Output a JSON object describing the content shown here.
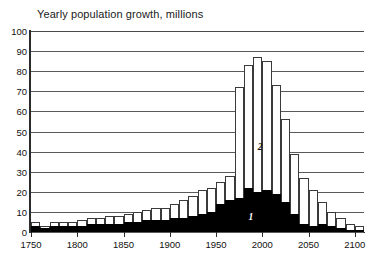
{
  "chart_data": {
    "type": "bar",
    "title": "Yearly population growth, millions",
    "xlabel": "",
    "ylabel": "",
    "ylim": [
      0,
      100
    ],
    "xlim": [
      1750,
      2110
    ],
    "grid": true,
    "legend_position": "inline-annotations",
    "stacked": true,
    "ytick_labels": [
      "100",
      "90",
      "80",
      "70",
      "60",
      "50",
      "40",
      "30",
      "20",
      "10",
      "0"
    ],
    "ytick_values": [
      100,
      90,
      80,
      70,
      60,
      50,
      40,
      30,
      20,
      10,
      0
    ],
    "xtick_labels": [
      "1750",
      "1800",
      "1850",
      "1900",
      "1950",
      "2000",
      "2050",
      "2100"
    ],
    "xtick_values": [
      1750,
      1800,
      1850,
      1900,
      1950,
      2000,
      2050,
      2100
    ],
    "categories": [
      1750,
      1760,
      1770,
      1780,
      1790,
      1800,
      1810,
      1820,
      1830,
      1840,
      1850,
      1860,
      1870,
      1880,
      1890,
      1900,
      1910,
      1920,
      1930,
      1940,
      1950,
      1960,
      1970,
      1980,
      1990,
      2000,
      2010,
      2020,
      2030,
      2040,
      2050,
      2060,
      2070,
      2080,
      2090,
      2100
    ],
    "series": [
      {
        "name": "1",
        "label": "1",
        "color": "#000000",
        "values": [
          3,
          2,
          3,
          3,
          3,
          3,
          4,
          4,
          4,
          4,
          5,
          5,
          6,
          6,
          6,
          7,
          7,
          8,
          9,
          10,
          14,
          16,
          17,
          22,
          20,
          21,
          19,
          15,
          9,
          4,
          3,
          4,
          3,
          2,
          1,
          1
        ]
      },
      {
        "name": "2",
        "label": "2",
        "color": "#ffffff",
        "values": [
          2,
          1,
          2,
          2,
          2,
          3,
          3,
          3,
          4,
          4,
          4,
          5,
          5,
          6,
          6,
          7,
          9,
          10,
          12,
          12,
          11,
          12,
          55,
          61,
          67,
          64,
          54,
          41,
          30,
          23,
          18,
          11,
          7,
          5,
          3,
          2
        ]
      }
    ],
    "totals": [
      5,
      3,
      5,
      5,
      5,
      6,
      7,
      7,
      8,
      8,
      9,
      10,
      11,
      12,
      12,
      14,
      16,
      18,
      21,
      22,
      25,
      28,
      72,
      83,
      87,
      85,
      73,
      56,
      39,
      27,
      21,
      15,
      10,
      7,
      4,
      3
    ],
    "annotations": [
      {
        "text": "1",
        "x": 1985,
        "y": 7,
        "color": "#ffffff",
        "style": "italic"
      },
      {
        "text": "2",
        "x": 1995,
        "y": 42,
        "color": "#111111",
        "style": "italic"
      }
    ]
  }
}
